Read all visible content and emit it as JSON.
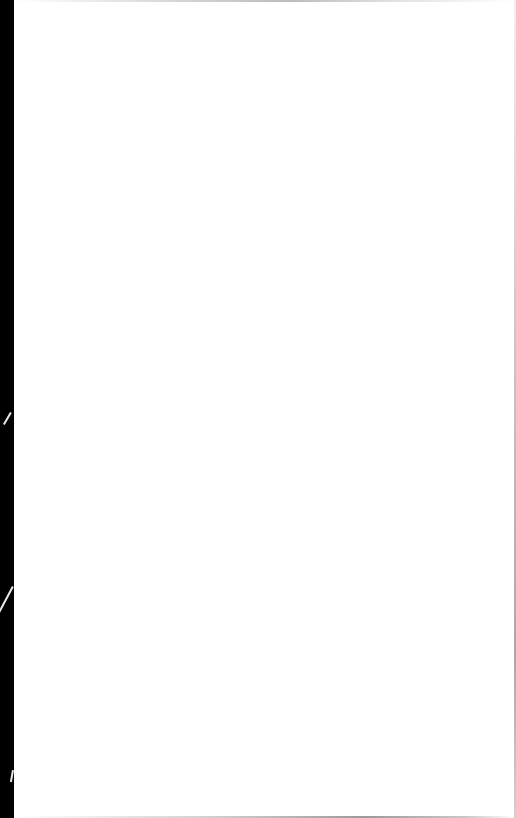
{
  "page": {
    "type": "blank-scanned-page",
    "text": "",
    "colors": {
      "paper": "#ffffff",
      "binding_edge": "#000000",
      "edge_shadow": "#bcbcbc"
    }
  }
}
